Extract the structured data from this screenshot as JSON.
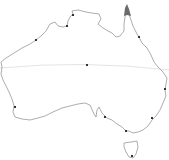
{
  "map": {
    "region": "Australia",
    "colors": {
      "background": "#ffffff",
      "coastline": "#8a8a8a",
      "tropic_line": "#d8d8d8",
      "marker": "#333333",
      "highlight": "#6b6b6b"
    },
    "tropic_line": {
      "name": "Tropic of Capricorn",
      "y": 65
    },
    "highlight_region": {
      "name": "Cape York tip"
    },
    "markers": [
      {
        "name": "Darwin",
        "x": 73,
        "y": 15
      },
      {
        "name": "Katherine area",
        "x": 67,
        "y": 26
      },
      {
        "name": "Broome",
        "x": 36,
        "y": 40
      },
      {
        "name": "Cairns",
        "x": 139,
        "y": 37
      },
      {
        "name": "Alice Springs (centre)",
        "x": 87,
        "y": 65
      },
      {
        "name": "Brisbane",
        "x": 165,
        "y": 89
      },
      {
        "name": "Perth",
        "x": 15,
        "y": 107
      },
      {
        "name": "Adelaide",
        "x": 105,
        "y": 117
      },
      {
        "name": "Sydney",
        "x": 152,
        "y": 118
      },
      {
        "name": "Melbourne",
        "x": 126,
        "y": 131
      },
      {
        "name": "Hobart",
        "x": 132,
        "y": 157
      }
    ]
  }
}
